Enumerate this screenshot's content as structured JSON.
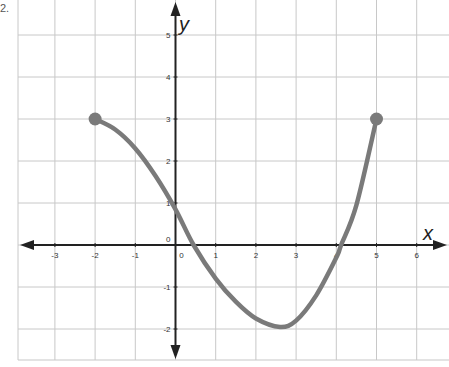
{
  "problem": {
    "label": "2."
  },
  "chart_data": {
    "type": "line",
    "title": "",
    "xlabel": "x",
    "ylabel": "y",
    "xlim": [
      -3.9,
      6.6
    ],
    "ylim": [
      -2.8,
      5.8
    ],
    "grid": true,
    "x_ticks": [
      -3,
      -2,
      -1,
      0,
      1,
      2,
      3,
      4,
      5,
      6
    ],
    "y_ticks": [
      -2,
      -1,
      0,
      1,
      2,
      3,
      4,
      5
    ],
    "x_tick_labels": [
      "-3",
      "-2",
      "-1",
      "0",
      "1",
      "2",
      "3",
      "4",
      "5",
      "6"
    ],
    "y_tick_labels": [
      "-2",
      "-1",
      "0",
      "1",
      "2",
      "3",
      "4",
      "5"
    ],
    "series": [
      {
        "name": "f(x)",
        "color": "#7a7a7a",
        "x": [
          -2,
          -1.5,
          -1,
          -0.5,
          0,
          0.45,
          1,
          1.5,
          2,
          2.6,
          3,
          3.5,
          4,
          4.12,
          4.5,
          5
        ],
        "y": [
          3,
          2.75,
          2.3,
          1.65,
          0.85,
          0,
          -0.8,
          -1.35,
          -1.75,
          -1.95,
          -1.8,
          -1.2,
          -0.3,
          0,
          0.95,
          3
        ]
      }
    ],
    "endpoints": [
      {
        "x": -2,
        "y": 3,
        "style": "closed"
      },
      {
        "x": 5,
        "y": 3,
        "style": "closed"
      }
    ],
    "legend": null
  },
  "colors": {
    "grid": "#c8c8c8",
    "axis": "#222222",
    "curve": "#7a7a7a",
    "tick_text": "#333333"
  }
}
